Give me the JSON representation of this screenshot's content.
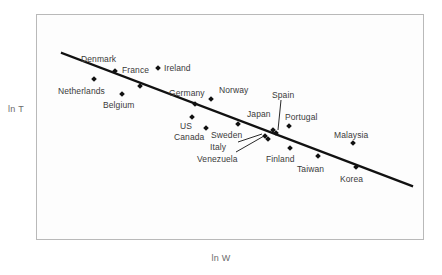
{
  "chart_data": {
    "type": "scatter",
    "title": "",
    "xlabel": "ln W",
    "ylabel": "ln T",
    "grid": false,
    "legend": null,
    "axis_ticks": {
      "x": [],
      "y": []
    },
    "trendline": {
      "present": true,
      "description": "downward-sloping fitted regression line",
      "x1": 62,
      "y1": 53,
      "x2": 412,
      "y2": 186
    },
    "points": [
      {
        "name": "Denmark",
        "mx": 115,
        "my": 71,
        "lx": 81,
        "ly": 55,
        "leader": false
      },
      {
        "name": "France",
        "mx": 140,
        "my": 86,
        "lx": 122,
        "ly": 66,
        "leader": false
      },
      {
        "name": "Ireland",
        "mx": 158,
        "my": 68,
        "lx": 164,
        "ly": 64,
        "leader": false
      },
      {
        "name": "Netherlands",
        "mx": 94,
        "my": 79,
        "lx": 58,
        "ly": 87,
        "leader": false
      },
      {
        "name": "Belgium",
        "mx": 122,
        "my": 94,
        "lx": 103,
        "ly": 101,
        "leader": false
      },
      {
        "name": "Germany",
        "mx": 195,
        "my": 104,
        "lx": 169,
        "ly": 89,
        "leader": false
      },
      {
        "name": "Norway",
        "mx": 211,
        "my": 99,
        "lx": 219,
        "ly": 86,
        "leader": false
      },
      {
        "name": "Spain",
        "mx": 276,
        "my": 133,
        "lx": 272,
        "ly": 91,
        "leader": true,
        "leader_path": "M 281 100 L 278 130"
      },
      {
        "name": "Japan",
        "mx": 273,
        "my": 130,
        "lx": 247,
        "ly": 110,
        "leader": false
      },
      {
        "name": "Portugal",
        "mx": 289,
        "my": 126,
        "lx": 285,
        "ly": 113,
        "leader": false
      },
      {
        "name": "US",
        "mx": 192,
        "my": 117,
        "lx": 180,
        "ly": 122,
        "leader": false
      },
      {
        "name": "Canada",
        "mx": 206,
        "my": 128,
        "lx": 174,
        "ly": 133,
        "leader": false
      },
      {
        "name": "Sweden",
        "mx": 238,
        "my": 124,
        "lx": 211,
        "ly": 131,
        "leader": false
      },
      {
        "name": "Italy",
        "mx": 265,
        "my": 136,
        "lx": 210,
        "ly": 143,
        "leader": true,
        "leader_path": "M 238 142 L 262 134"
      },
      {
        "name": "Venezuela",
        "mx": 268,
        "my": 139,
        "lx": 197,
        "ly": 155,
        "leader": true,
        "leader_path": "M 236 152 L 264 136"
      },
      {
        "name": "Finland",
        "mx": 290,
        "my": 148,
        "lx": 266,
        "ly": 155,
        "leader": false
      },
      {
        "name": "Taiwan",
        "mx": 318,
        "my": 156,
        "lx": 297,
        "ly": 165,
        "leader": false
      },
      {
        "name": "Malaysia",
        "mx": 353,
        "my": 143,
        "lx": 334,
        "ly": 131,
        "leader": false
      },
      {
        "name": "Korea",
        "mx": 356,
        "my": 167,
        "lx": 340,
        "ly": 175,
        "leader": false
      }
    ]
  },
  "colors": {
    "marker": "#111111",
    "trendline": "#111111",
    "frame": "#b9b9b9",
    "label_text": "#3a3a3a",
    "axis_text": "#6b6b6b",
    "plot_background": "#fdfdfd",
    "page_background": "#ffffff"
  }
}
